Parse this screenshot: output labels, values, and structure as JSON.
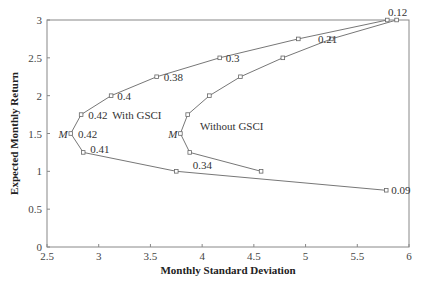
{
  "chart_data": {
    "type": "line",
    "title": "",
    "xlabel": "Monthly Standard Deviation",
    "ylabel": "Expected Monthly Return",
    "xlim": [
      2.5,
      6
    ],
    "ylim": [
      0,
      3
    ],
    "xticks": [
      "2.5",
      "3",
      "3.5",
      "4",
      "4.5",
      "5",
      "5.5",
      "6"
    ],
    "yticks": [
      "0",
      "0.5",
      "1",
      "1.5",
      "2",
      "2.5",
      "3"
    ],
    "grid": false,
    "legend": "inline labels",
    "series": [
      {
        "name": "With GSCI",
        "points": [
          {
            "x": 5.79,
            "y": 3.0
          },
          {
            "x": 4.93,
            "y": 2.75
          },
          {
            "x": 4.17,
            "y": 2.5
          },
          {
            "x": 3.56,
            "y": 2.25
          },
          {
            "x": 3.12,
            "y": 2.0
          },
          {
            "x": 2.83,
            "y": 1.75
          },
          {
            "x": 2.73,
            "y": 1.5
          },
          {
            "x": 2.85,
            "y": 1.25
          },
          {
            "x": 3.75,
            "y": 1.0
          },
          {
            "x": 5.78,
            "y": 0.75
          }
        ]
      },
      {
        "name": "Without GSCI",
        "points": [
          {
            "x": 5.88,
            "y": 3.0
          },
          {
            "x": 5.25,
            "y": 2.75
          },
          {
            "x": 4.78,
            "y": 2.5
          },
          {
            "x": 4.37,
            "y": 2.25
          },
          {
            "x": 4.07,
            "y": 2.0
          },
          {
            "x": 3.86,
            "y": 1.75
          },
          {
            "x": 3.79,
            "y": 1.5
          },
          {
            "x": 3.88,
            "y": 1.25
          },
          {
            "x": 4.57,
            "y": 1.0
          }
        ]
      }
    ],
    "annotations": [
      {
        "text": "0.12",
        "x": 5.86,
        "y": 3.0,
        "note": "GSCI weight at top"
      },
      {
        "text": "0.21",
        "x": 5.09,
        "y": 2.75
      },
      {
        "text": "0.3",
        "x": 4.2,
        "y": 2.5
      },
      {
        "text": "0.38",
        "x": 3.6,
        "y": 2.25
      },
      {
        "text": "0.4",
        "x": 3.15,
        "y": 2.0
      },
      {
        "text": "0.42",
        "x": 2.87,
        "y": 1.75
      },
      {
        "text": "0.42",
        "x": 2.77,
        "y": 1.5
      },
      {
        "text": "0.41",
        "x": 2.89,
        "y": 1.3
      },
      {
        "text": "0.34",
        "x": 3.88,
        "y": 1.08
      },
      {
        "text": "0.09",
        "x": 5.8,
        "y": 0.75
      },
      {
        "text": "M",
        "x": 2.73,
        "y": 1.5,
        "note": "minimum variance, with GSCI"
      },
      {
        "text": "M",
        "x": 3.79,
        "y": 1.5,
        "note": "minimum variance, without GSCI"
      }
    ],
    "series_labels": [
      {
        "text": "With GSCI",
        "x": 3.13,
        "y": 1.75
      },
      {
        "text": "Without GSCI",
        "x": 3.98,
        "y": 1.6
      }
    ]
  }
}
